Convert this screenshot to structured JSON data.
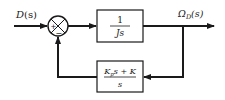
{
  "diagram": {
    "type": "block-diagram",
    "input": {
      "label_main": "D",
      "label_arg": "(s)"
    },
    "summing_junction": {
      "signs": {
        "left": "+",
        "bottom": "−"
      }
    },
    "forward_block": {
      "numerator": "1",
      "denominator": "Js"
    },
    "output": {
      "label_main": "Ω",
      "label_sub": "D",
      "label_arg": "(s)"
    },
    "feedback_block": {
      "numerator_k": "K",
      "numerator_k_sub": "p",
      "numerator_rest": "s + K",
      "denominator": "s"
    },
    "colors": {
      "stroke": "#1a1a1a",
      "background": "#ffffff"
    }
  }
}
